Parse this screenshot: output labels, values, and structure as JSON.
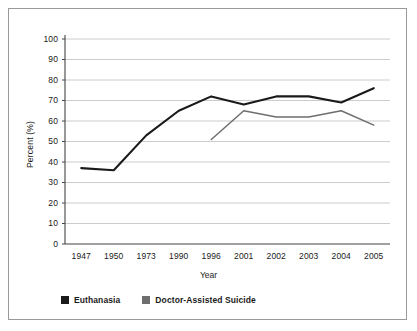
{
  "chart_data": {
    "type": "line",
    "title": "",
    "xlabel": "Year",
    "ylabel": "Percent (%)",
    "categories": [
      "1947",
      "1950",
      "1973",
      "1990",
      "1996",
      "2001",
      "2002",
      "2003",
      "2004",
      "2005"
    ],
    "ylim": [
      0,
      100
    ],
    "ytick_step": 10,
    "yticks": [
      "0",
      "10",
      "20",
      "30",
      "40",
      "50",
      "60",
      "70",
      "80",
      "90",
      "100"
    ],
    "grid": true,
    "grid_axis": "y",
    "legend_position": "bottom-left",
    "series": [
      {
        "name": "Euthanasia",
        "color": "#1a1a1a",
        "values": [
          37,
          36,
          53,
          65,
          72,
          68,
          72,
          72,
          69,
          76
        ]
      },
      {
        "name": "Doctor-Assisted Suicide",
        "color": "#6e6e6e",
        "values": [
          null,
          null,
          null,
          null,
          51,
          65,
          62,
          62,
          65,
          58
        ]
      }
    ]
  },
  "legend": {
    "items": [
      {
        "label": "Euthanasia",
        "color": "#1a1a1a"
      },
      {
        "label": "Doctor-Assisted Suicide",
        "color": "#6e6e6e"
      }
    ]
  },
  "axes": {
    "y_title": "Percent (%)",
    "x_title": "Year"
  },
  "colors": {
    "frame": "#999999",
    "grid": "#bfbfbf",
    "axis": "#444444",
    "series_primary": "#1a1a1a",
    "series_secondary": "#6e6e6e",
    "background": "#ffffff"
  }
}
